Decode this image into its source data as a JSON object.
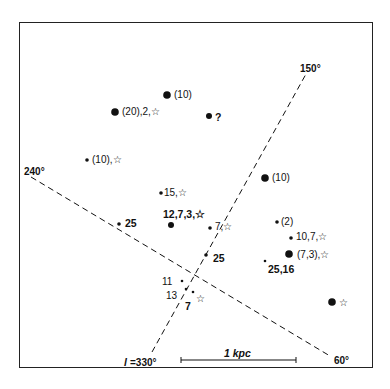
{
  "diagram": {
    "type": "galactic-map",
    "colors": {
      "ink": "#111111",
      "frame": "#222222",
      "background": "#ffffff"
    },
    "axes": [
      {
        "id": "l330-150",
        "from_label": "l=330°",
        "to_label": "150°"
      },
      {
        "id": "l240-60",
        "from_label": "240°",
        "to_label": "60°"
      }
    ],
    "axis_labels": {
      "l150": "150°",
      "l240": "240°",
      "l60": "60°",
      "l330_prefix": "l",
      "l330": "=330°"
    },
    "scale_bar": {
      "label": "1 kpc",
      "length_kpc": 1
    },
    "objects": [
      {
        "size": "large",
        "label": "(10)"
      },
      {
        "size": "large",
        "label": "(20),2,☆"
      },
      {
        "size": "medium",
        "label": "?"
      },
      {
        "size": "small",
        "label": "(10),☆"
      },
      {
        "size": "large",
        "label": "(10)"
      },
      {
        "size": "small",
        "label": "15,☆"
      },
      {
        "size": "medium",
        "label": "12,7,3,☆"
      },
      {
        "size": "small",
        "label": "25"
      },
      {
        "size": "small",
        "label": "7,☆"
      },
      {
        "size": "small",
        "label": "25"
      },
      {
        "size": "small",
        "label": "(2)"
      },
      {
        "size": "small",
        "label": "10,7,☆"
      },
      {
        "size": "large",
        "label": "(7,3),☆"
      },
      {
        "size": "tiny",
        "label": "25,16"
      },
      {
        "size": "tiny",
        "label": "11"
      },
      {
        "size": "tiny",
        "label": "13"
      },
      {
        "size": "tiny",
        "label": "7"
      },
      {
        "size": "none",
        "label": "☆"
      },
      {
        "size": "large",
        "label": "☆"
      }
    ]
  }
}
